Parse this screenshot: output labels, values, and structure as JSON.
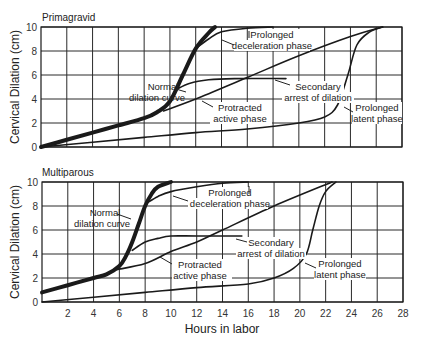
{
  "chart_data": [
    {
      "type": "line",
      "title": "Primagravid",
      "xlabel": "Hours in labor",
      "ylabel": "Cervical Dilation (cm)",
      "xlim": [
        0,
        28
      ],
      "ylim": [
        0,
        10
      ],
      "xticks": [
        2,
        4,
        6,
        8,
        10,
        12,
        14,
        16,
        18,
        20,
        22,
        24,
        26,
        28
      ],
      "yticks": [
        0,
        2,
        4,
        6,
        8,
        10
      ],
      "grid": true,
      "series": [
        {
          "name": "Normal dilation curve",
          "style": "bold",
          "x": [
            0,
            2,
            4,
            6,
            8,
            9,
            10,
            11,
            12,
            13,
            13.5
          ],
          "y": [
            0,
            0.6,
            1.2,
            1.8,
            2.4,
            2.9,
            3.8,
            6.0,
            8.2,
            9.5,
            10
          ]
        },
        {
          "name": "Prolonged deceleration phase",
          "x": [
            12,
            13,
            14,
            16,
            18
          ],
          "y": [
            8.2,
            9.0,
            9.6,
            9.9,
            10
          ]
        },
        {
          "name": "Secondary arrest of dilation",
          "x": [
            10.5,
            11.5,
            13,
            15,
            19
          ],
          "y": [
            4.8,
            5.3,
            5.6,
            5.7,
            5.7
          ]
        },
        {
          "name": "Protracted active phase",
          "x": [
            9.5,
            12,
            16,
            20,
            24,
            26.5
          ],
          "y": [
            3.0,
            4.0,
            5.8,
            7.6,
            9.2,
            10
          ]
        },
        {
          "name": "Prolonged latent phase",
          "x": [
            0,
            4,
            8,
            12,
            16,
            20,
            22,
            23,
            23.8,
            24.5,
            25.5,
            26.5
          ],
          "y": [
            0,
            0.4,
            0.8,
            1.2,
            1.5,
            2.0,
            2.5,
            3.5,
            6.0,
            8.5,
            9.6,
            10
          ]
        }
      ]
    },
    {
      "type": "line",
      "title": "Multiparous",
      "xlabel": "Hours in labor",
      "ylabel": "Cervical Dilation (cm)",
      "xlim": [
        0,
        28
      ],
      "ylim": [
        0,
        10
      ],
      "xticks": [
        2,
        4,
        6,
        8,
        10,
        12,
        14,
        16,
        18,
        20,
        22,
        24,
        26,
        28
      ],
      "yticks": [
        0,
        2,
        4,
        6,
        8,
        10
      ],
      "grid": true,
      "series": [
        {
          "name": "Normal dilation curve",
          "style": "bold",
          "x": [
            0,
            2,
            4,
            5,
            6,
            6.5,
            7,
            7.5,
            8,
            8.5,
            9,
            10
          ],
          "y": [
            0.8,
            1.4,
            2.0,
            2.3,
            3.0,
            3.8,
            5.0,
            6.5,
            8.0,
            9.0,
            9.6,
            10
          ]
        },
        {
          "name": "Prolonged deceleration phase",
          "x": [
            8.2,
            9,
            10,
            12,
            14,
            16
          ],
          "y": [
            8.3,
            8.8,
            9.2,
            9.6,
            9.9,
            10
          ]
        },
        {
          "name": "Secondary arrest of dilation",
          "x": [
            7,
            8,
            9,
            10,
            12,
            15.5
          ],
          "y": [
            4.3,
            5.0,
            5.3,
            5.5,
            5.5,
            5.5
          ]
        },
        {
          "name": "Protracted active phase",
          "x": [
            5.8,
            8,
            10,
            12,
            14,
            18,
            22.5
          ],
          "y": [
            2.7,
            3.2,
            4.2,
            5.0,
            6.0,
            8.0,
            10
          ]
        },
        {
          "name": "Prolonged latent phase",
          "x": [
            0,
            4,
            8,
            12,
            16,
            18,
            19.5,
            20.5,
            21,
            21.5,
            22,
            22.8
          ],
          "y": [
            0,
            0.4,
            0.8,
            1.2,
            1.5,
            2.0,
            2.8,
            4.0,
            6.0,
            8.0,
            9.2,
            10
          ]
        }
      ]
    }
  ],
  "panels": {
    "top": {
      "title": "Primagravid",
      "ylabel": "Cervical Dilation (cm)",
      "annotations": {
        "normal_1": "Normal",
        "normal_2": "dilation curve",
        "decel_1": "Prolonged",
        "decel_2": "deceleration phase",
        "arrest_1": "Secondary",
        "arrest_2": "arrest of dilation",
        "protracted_1": "Protracted",
        "protracted_2": "active phase",
        "latent_1": "Prolonged",
        "latent_2": "latent phase"
      }
    },
    "bottom": {
      "title": "Multiparous",
      "ylabel": "Cervical Dilation (cm)",
      "annotations": {
        "normal_1": "Normal",
        "normal_2": "dilation curve",
        "decel_1": "Prolonged",
        "decel_2": "deceleration phase",
        "arrest_1": "Secondary",
        "arrest_2": "arrest of dilation",
        "protracted_1": "Protracted",
        "protracted_2": "active phase",
        "latent_1": "Prolonged",
        "latent_2": "latent phase"
      }
    }
  },
  "xaxis": {
    "label": "Hours in labor",
    "ticks": [
      "2",
      "4",
      "6",
      "8",
      "10",
      "12",
      "14",
      "16",
      "18",
      "20",
      "22",
      "24",
      "26",
      "28"
    ]
  },
  "yaxis": {
    "ticks": [
      "0",
      "2",
      "4",
      "6",
      "8",
      "10"
    ]
  }
}
